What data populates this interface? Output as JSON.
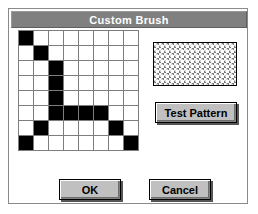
{
  "dialog": {
    "title": "Custom Brush",
    "colors": {
      "titlebar_bg": "#808080",
      "titlebar_text": "#ffffff",
      "dialog_bg": "#ffffff",
      "button_face": "#c0c0c0",
      "grid_line": "#7d7d7d",
      "cell_on": "#000000",
      "cell_off": "#ffffff"
    }
  },
  "brush_grid": {
    "name": "custom-brush-editor",
    "columns": 8,
    "rows": 8,
    "cells": [
      [
        1,
        0,
        0,
        0,
        0,
        0,
        0,
        0
      ],
      [
        0,
        1,
        0,
        0,
        0,
        0,
        0,
        0
      ],
      [
        0,
        0,
        1,
        0,
        0,
        0,
        0,
        0
      ],
      [
        0,
        0,
        1,
        0,
        0,
        0,
        0,
        0
      ],
      [
        0,
        0,
        1,
        0,
        0,
        0,
        0,
        0
      ],
      [
        0,
        0,
        1,
        1,
        1,
        1,
        0,
        0
      ],
      [
        0,
        1,
        0,
        0,
        0,
        0,
        1,
        0
      ],
      [
        1,
        0,
        0,
        0,
        0,
        0,
        0,
        1
      ]
    ]
  },
  "preview": {
    "name": "pattern-preview",
    "description": "diagonal-hatch-pattern-swatch"
  },
  "buttons": {
    "test_pattern": "Test Pattern",
    "ok": "OK",
    "cancel": "Cancel"
  }
}
